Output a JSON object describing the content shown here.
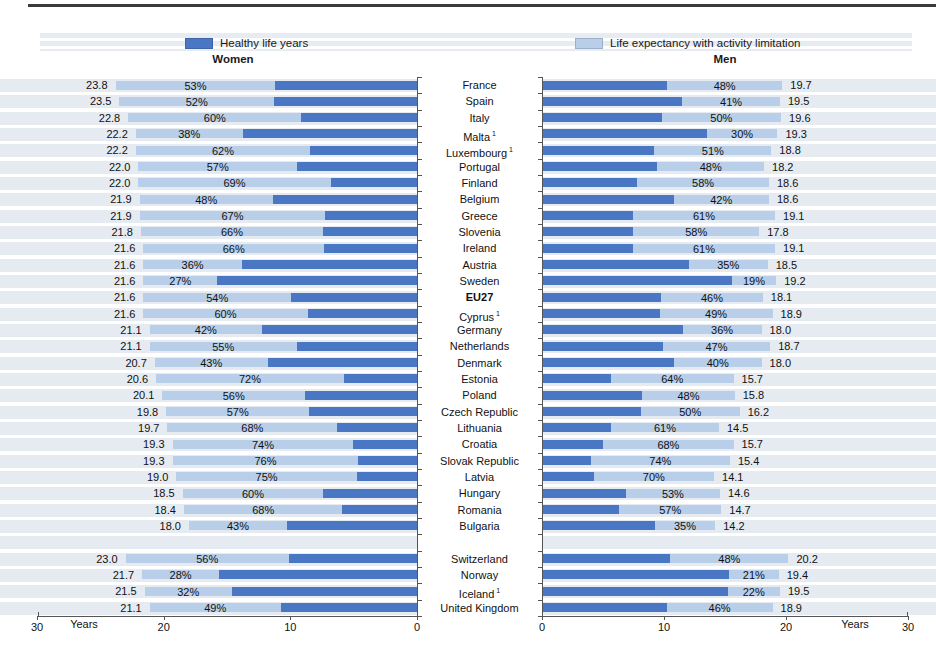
{
  "colors": {
    "healthy": "#4a77c4",
    "limitation": "#b9cfe9",
    "stripe": "#e6ebf1",
    "axis": "#555555",
    "rule": "#3a3a3a"
  },
  "chart_data": {
    "type": "bar",
    "subtype": "mirrored-stacked-horizontal",
    "unit": "Years",
    "axis_range": [
      0,
      30
    ],
    "axis_ticks_women": [
      "30",
      "20",
      "10",
      "0"
    ],
    "axis_ticks_men": [
      "0",
      "10",
      "20",
      "30"
    ],
    "axis_unit_label": "Years",
    "footnote_marker": "1",
    "legend": [
      {
        "label": "Healthy life years",
        "color": "#4a77c4"
      },
      {
        "label": "Life expectancy with activity limitation",
        "color": "#b9cfe9"
      }
    ],
    "panels": [
      {
        "title": "Women",
        "direction": "right-to-left"
      },
      {
        "title": "Men",
        "direction": "left-to-right"
      }
    ],
    "value_notes": "life_expectancy = total bar length in years at outer label; pct_limitation = % label shown inside light segment (share of life expectancy with activity limitation); healthy life years = life_expectancy * (1 - pct_limitation/100)",
    "rows": [
      {
        "country": "France",
        "women": {
          "life_expectancy": 23.8,
          "pct_limitation": 53
        },
        "men": {
          "life_expectancy": 19.7,
          "pct_limitation": 48
        }
      },
      {
        "country": "Spain",
        "women": {
          "life_expectancy": 23.5,
          "pct_limitation": 52
        },
        "men": {
          "life_expectancy": 19.5,
          "pct_limitation": 41
        }
      },
      {
        "country": "Italy",
        "women": {
          "life_expectancy": 22.8,
          "pct_limitation": 60
        },
        "men": {
          "life_expectancy": 19.6,
          "pct_limitation": 50
        }
      },
      {
        "country": "Malta",
        "footnote": true,
        "women": {
          "life_expectancy": 22.2,
          "pct_limitation": 38
        },
        "men": {
          "life_expectancy": 19.3,
          "pct_limitation": 30
        }
      },
      {
        "country": "Luxembourg",
        "footnote": true,
        "women": {
          "life_expectancy": 22.2,
          "pct_limitation": 62
        },
        "men": {
          "life_expectancy": 18.8,
          "pct_limitation": 51
        }
      },
      {
        "country": "Portugal",
        "women": {
          "life_expectancy": 22.0,
          "pct_limitation": 57
        },
        "men": {
          "life_expectancy": 18.2,
          "pct_limitation": 48
        }
      },
      {
        "country": "Finland",
        "women": {
          "life_expectancy": 22.0,
          "pct_limitation": 69
        },
        "men": {
          "life_expectancy": 18.6,
          "pct_limitation": 58
        }
      },
      {
        "country": "Belgium",
        "women": {
          "life_expectancy": 21.9,
          "pct_limitation": 48
        },
        "men": {
          "life_expectancy": 18.6,
          "pct_limitation": 42
        }
      },
      {
        "country": "Greece",
        "women": {
          "life_expectancy": 21.9,
          "pct_limitation": 67
        },
        "men": {
          "life_expectancy": 19.1,
          "pct_limitation": 61
        }
      },
      {
        "country": "Slovenia",
        "women": {
          "life_expectancy": 21.8,
          "pct_limitation": 66
        },
        "men": {
          "life_expectancy": 17.8,
          "pct_limitation": 58
        }
      },
      {
        "country": "Ireland",
        "women": {
          "life_expectancy": 21.6,
          "pct_limitation": 66
        },
        "men": {
          "life_expectancy": 19.1,
          "pct_limitation": 61
        }
      },
      {
        "country": "Austria",
        "women": {
          "life_expectancy": 21.6,
          "pct_limitation": 36
        },
        "men": {
          "life_expectancy": 18.5,
          "pct_limitation": 35
        }
      },
      {
        "country": "Sweden",
        "women": {
          "life_expectancy": 21.6,
          "pct_limitation": 27
        },
        "men": {
          "life_expectancy": 19.2,
          "pct_limitation": 19
        }
      },
      {
        "country": "EU27",
        "bold": true,
        "women": {
          "life_expectancy": 21.6,
          "pct_limitation": 54
        },
        "men": {
          "life_expectancy": 18.1,
          "pct_limitation": 46
        }
      },
      {
        "country": "Cyprus",
        "footnote": true,
        "women": {
          "life_expectancy": 21.6,
          "pct_limitation": 60
        },
        "men": {
          "life_expectancy": 18.9,
          "pct_limitation": 49
        }
      },
      {
        "country": "Germany",
        "women": {
          "life_expectancy": 21.1,
          "pct_limitation": 42
        },
        "men": {
          "life_expectancy": 18.0,
          "pct_limitation": 36
        }
      },
      {
        "country": "Netherlands",
        "women": {
          "life_expectancy": 21.1,
          "pct_limitation": 55
        },
        "men": {
          "life_expectancy": 18.7,
          "pct_limitation": 47
        }
      },
      {
        "country": "Denmark",
        "women": {
          "life_expectancy": 20.7,
          "pct_limitation": 43
        },
        "men": {
          "life_expectancy": 18.0,
          "pct_limitation": 40
        }
      },
      {
        "country": "Estonia",
        "women": {
          "life_expectancy": 20.6,
          "pct_limitation": 72
        },
        "men": {
          "life_expectancy": 15.7,
          "pct_limitation": 64
        }
      },
      {
        "country": "Poland",
        "women": {
          "life_expectancy": 20.1,
          "pct_limitation": 56
        },
        "men": {
          "life_expectancy": 15.8,
          "pct_limitation": 48
        }
      },
      {
        "country": "Czech Republic",
        "women": {
          "life_expectancy": 19.8,
          "pct_limitation": 57
        },
        "men": {
          "life_expectancy": 16.2,
          "pct_limitation": 50
        }
      },
      {
        "country": "Lithuania",
        "women": {
          "life_expectancy": 19.7,
          "pct_limitation": 68
        },
        "men": {
          "life_expectancy": 14.5,
          "pct_limitation": 61
        }
      },
      {
        "country": "Croatia",
        "women": {
          "life_expectancy": 19.3,
          "pct_limitation": 74
        },
        "men": {
          "life_expectancy": 15.7,
          "pct_limitation": 68
        }
      },
      {
        "country": "Slovak Republic",
        "women": {
          "life_expectancy": 19.3,
          "pct_limitation": 76
        },
        "men": {
          "life_expectancy": 15.4,
          "pct_limitation": 74
        }
      },
      {
        "country": "Latvia",
        "women": {
          "life_expectancy": 19.0,
          "pct_limitation": 75
        },
        "men": {
          "life_expectancy": 14.1,
          "pct_limitation": 70
        }
      },
      {
        "country": "Hungary",
        "women": {
          "life_expectancy": 18.5,
          "pct_limitation": 60
        },
        "men": {
          "life_expectancy": 14.6,
          "pct_limitation": 53
        }
      },
      {
        "country": "Romania",
        "women": {
          "life_expectancy": 18.4,
          "pct_limitation": 68
        },
        "men": {
          "life_expectancy": 14.7,
          "pct_limitation": 57
        }
      },
      {
        "country": "Bulgaria",
        "women": {
          "life_expectancy": 18.0,
          "pct_limitation": 43
        },
        "men": {
          "life_expectancy": 14.2,
          "pct_limitation": 35
        }
      },
      {
        "country": "Switzerland",
        "gap_before": true,
        "women": {
          "life_expectancy": 23.0,
          "pct_limitation": 56
        },
        "men": {
          "life_expectancy": 20.2,
          "pct_limitation": 48
        }
      },
      {
        "country": "Norway",
        "women": {
          "life_expectancy": 21.7,
          "pct_limitation": 28
        },
        "men": {
          "life_expectancy": 19.4,
          "pct_limitation": 21
        }
      },
      {
        "country": "Iceland",
        "footnote": true,
        "women": {
          "life_expectancy": 21.5,
          "pct_limitation": 32
        },
        "men": {
          "life_expectancy": 19.5,
          "pct_limitation": 22
        }
      },
      {
        "country": "United Kingdom",
        "women": {
          "life_expectancy": 21.1,
          "pct_limitation": 49
        },
        "men": {
          "life_expectancy": 18.9,
          "pct_limitation": 46
        }
      }
    ]
  }
}
